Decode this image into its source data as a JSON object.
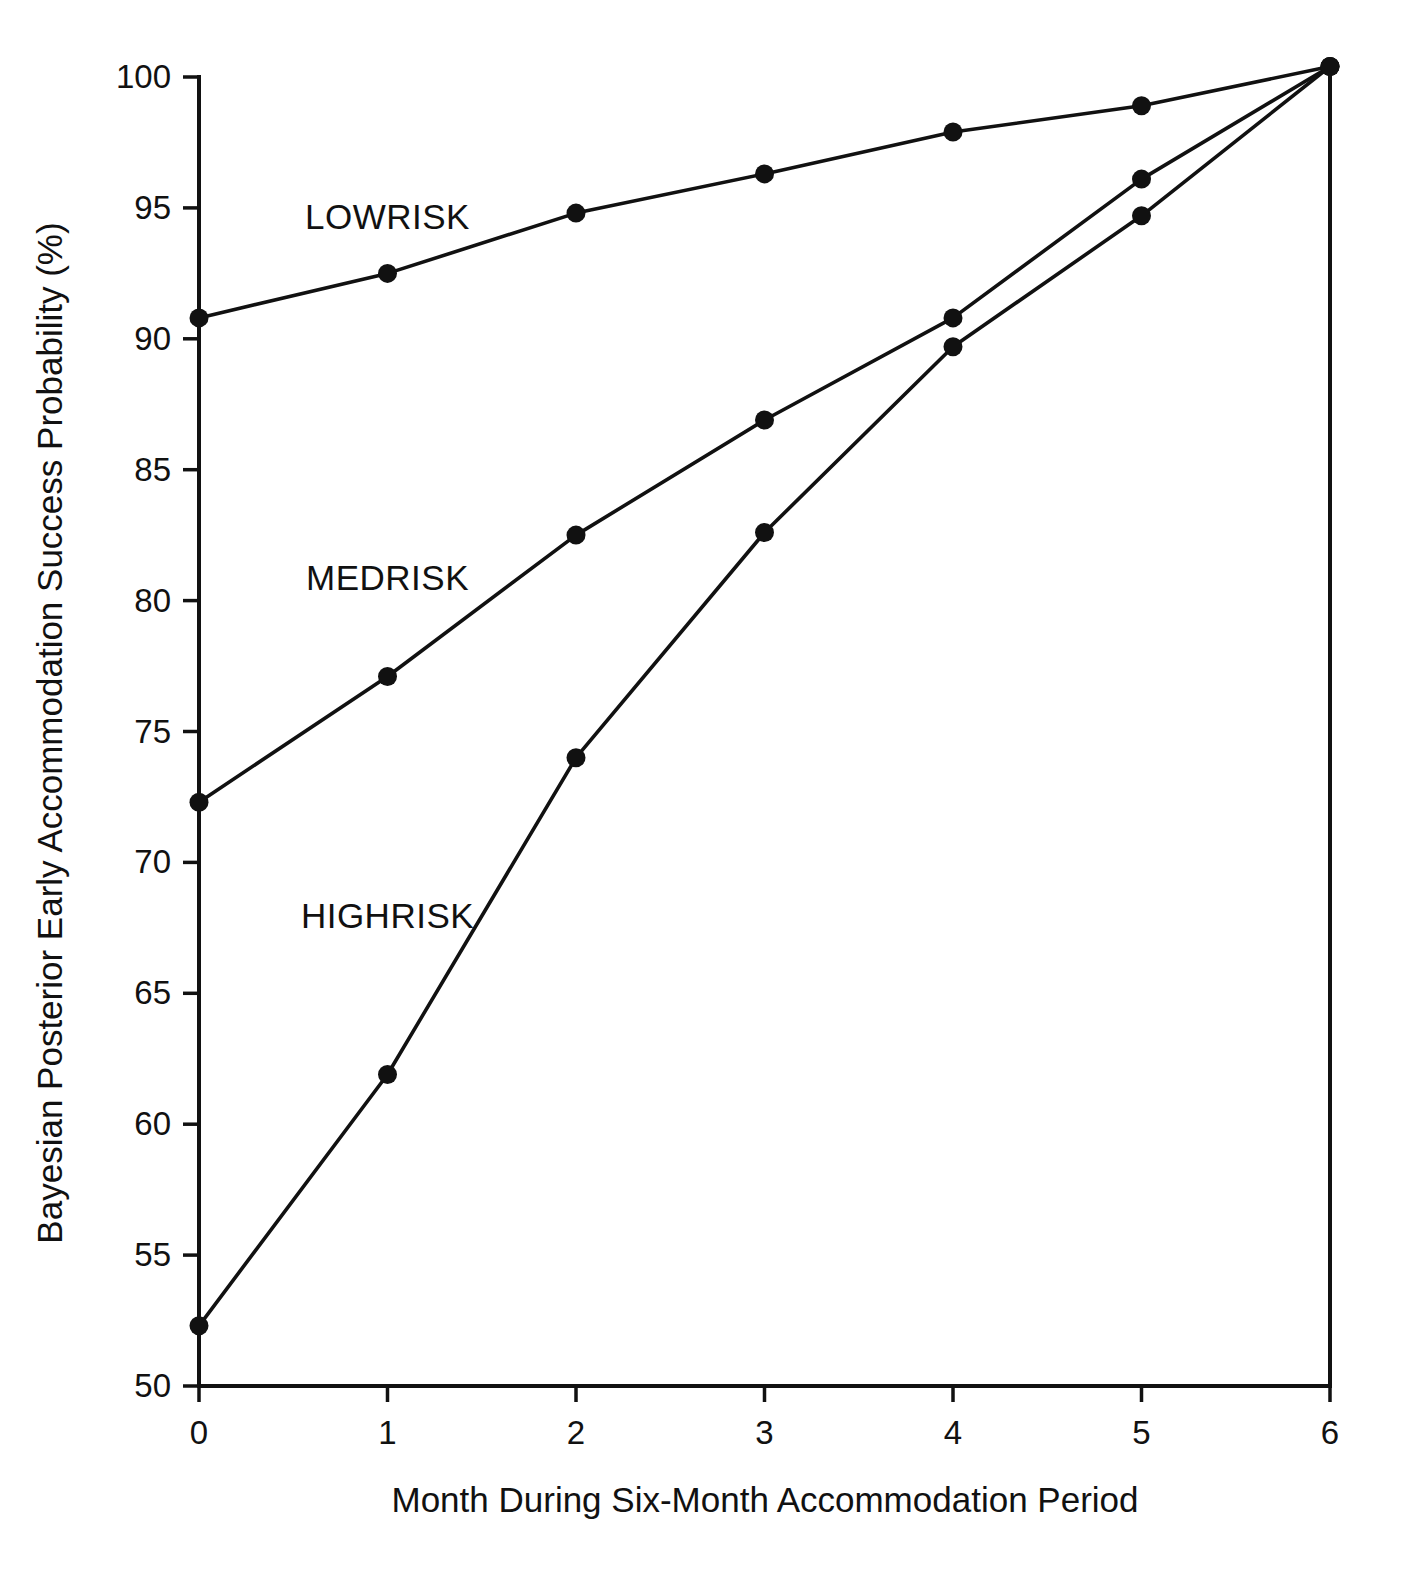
{
  "chart_data": {
    "type": "line",
    "title": "",
    "xlabel": "Month During Six-Month Accommodation Period",
    "ylabel": "Bayesian Posterior Early Accommodation Success Probability (%)",
    "x": [
      0,
      1,
      2,
      3,
      4,
      5,
      6
    ],
    "xticklabels": [
      "0",
      "1",
      "2",
      "3",
      "4",
      "5",
      "6"
    ],
    "yticklabels": [
      "100",
      "95",
      "90",
      "85",
      "80",
      "75",
      "70",
      "65",
      "60",
      "55",
      "50"
    ],
    "yticks": [
      100,
      95,
      90,
      85,
      80,
      75,
      70,
      65,
      60,
      55,
      50
    ],
    "xlim": [
      0,
      6
    ],
    "ylim": [
      50,
      100.5
    ],
    "grid": false,
    "legend_position": "inline-annotations",
    "marker": "filled-circle",
    "line_color": "#111111",
    "series": [
      {
        "name": "LOWRISK",
        "label_x": 1.0,
        "label_y": 94.2,
        "values": [
          90.8,
          92.5,
          94.8,
          96.3,
          97.9,
          98.9,
          100.4
        ]
      },
      {
        "name": "MEDRISK",
        "label_x": 1.0,
        "label_y": 80.4,
        "values": [
          72.3,
          77.1,
          82.5,
          86.9,
          90.8,
          96.1,
          100.4
        ]
      },
      {
        "name": "HIGHRISK",
        "label_x": 1.0,
        "label_y": 67.5,
        "values": [
          52.3,
          61.9,
          74.0,
          82.6,
          89.7,
          94.7,
          100.4
        ]
      }
    ]
  }
}
